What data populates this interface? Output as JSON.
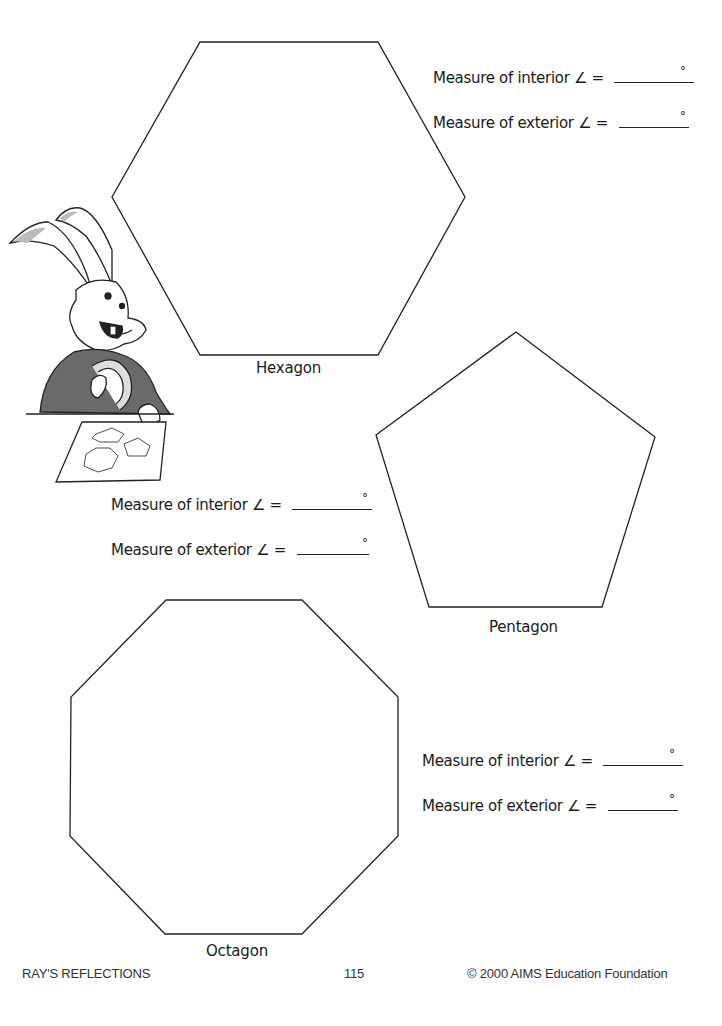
{
  "shapes": {
    "hexagon": {
      "label": "Hexagon",
      "points": [
        [
          200,
          42
        ],
        [
          378,
          42
        ],
        [
          465,
          197
        ],
        [
          378,
          355
        ],
        [
          200,
          355
        ],
        [
          112,
          197
        ]
      ]
    },
    "pentagon": {
      "label": "Pentagon",
      "points": [
        [
          516,
          332
        ],
        [
          655,
          437
        ],
        [
          602,
          607
        ],
        [
          429,
          607
        ],
        [
          376,
          435
        ]
      ]
    },
    "octagon": {
      "label": "Octagon",
      "points": [
        [
          166,
          600
        ],
        [
          302,
          600
        ],
        [
          398,
          697
        ],
        [
          398,
          836
        ],
        [
          302,
          934
        ],
        [
          165,
          934
        ],
        [
          70,
          836
        ],
        [
          71,
          697
        ]
      ]
    }
  },
  "measures": {
    "hexagon": {
      "interior_label": "Measure of interior ∠ =",
      "exterior_label": "Measure of exterior ∠ =",
      "interior_value": "",
      "exterior_value": "",
      "degree_symbol": "°"
    },
    "pentagon": {
      "interior_label": "Measure of interior ∠ =",
      "exterior_label": "Measure of exterior ∠ =",
      "interior_value": "",
      "exterior_value": "",
      "degree_symbol": "°"
    },
    "octagon": {
      "interior_label": "Measure of interior ∠ =",
      "exterior_label": "Measure of exterior ∠ =",
      "interior_value": "",
      "exterior_value": "",
      "degree_symbol": "°"
    }
  },
  "illustration": {
    "subject": "rabbit-with-protractor-icon"
  },
  "footer": {
    "left": "RAY'S REFLECTIONS",
    "center": "115",
    "right": "© 2000 AIMS Education Foundation"
  }
}
